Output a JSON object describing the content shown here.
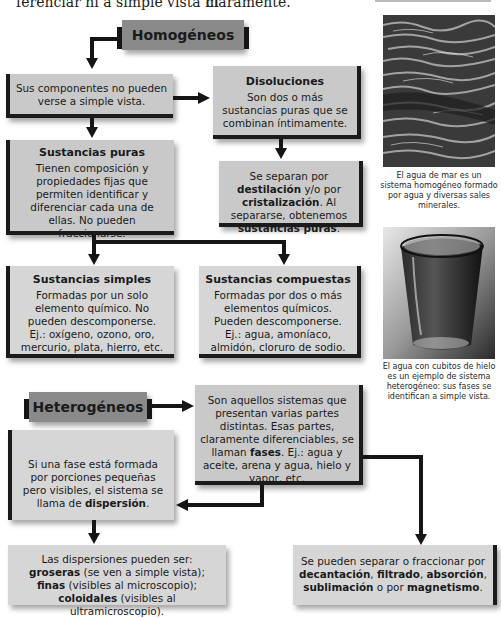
{
  "top_text": {
    "left": "ferenciar ni a simple vista ni",
    "right": "claramente."
  },
  "homogeneos": {
    "header": "Homogéneos",
    "no_visible": "Sus componentes no pueden verse a simple vista.",
    "disoluciones": {
      "title": "Disoluciones",
      "body": "Son dos o más sustancias puras que se combinan íntimamente."
    },
    "separacion": {
      "p1": "Se separan por ",
      "b1": "destilación",
      "p2": " y/o por ",
      "b2": "cristalización",
      "p3": ". Al separarse, obtenemos ",
      "b3": "sustancias puras",
      "p4": "."
    },
    "sustancias_puras": {
      "title": "Sustancias puras",
      "body": "Tienen composición y propiedades fijas que permiten identificar y diferenciar cada una de ellas. No pueden fraccionarse."
    },
    "sustancias_simples": {
      "title": "Sustancias simples",
      "body": "Formadas por un solo elemento químico. No pueden descomponerse. Ej.: oxígeno, ozono, oro, mercurio, plata, hierro, etc."
    },
    "sustancias_compuestas": {
      "title": "Sustancias compuestas",
      "body": "Formadas por dos o más elementos químicos. Pueden descomponerse. Ej.: agua, amoníaco, almidón, cloruro de sodio."
    }
  },
  "heterogeneos": {
    "header": "Heterogéneos",
    "definicion": {
      "p1": "Son aquellos sistemas que presentan varias partes distintas. Esas partes, claramente diferenciables, se llaman ",
      "b1": "fases",
      "p2": ". Ej.: agua y aceite, arena y agua, hielo y vapor, etc."
    },
    "dispersion": {
      "p1": "Si una fase está formada por porciones pequeñas pero visibles, el sistema se llama de ",
      "b1": "dispersión",
      "p2": "."
    },
    "tipos_dispersion": {
      "p1": "Las dispersiones pueden ser: ",
      "b1": "groseras",
      "p2": " (se ven a simple vista); ",
      "b2": "finas",
      "p3": " (visibles al microscopio); ",
      "b3": "coloidales",
      "p4": " (visibles al ultramicroscopio)."
    },
    "separacion": {
      "p1": "Se pueden separar o fraccionar por ",
      "b1": "decantación",
      "c1": ", ",
      "b2": "filtrado",
      "c2": ", ",
      "b3": "absorción",
      "c3": ", ",
      "b4": "sublimación",
      "p2": " o por ",
      "b5": "magnetismo",
      "p3": "."
    }
  },
  "photos": {
    "sea": {
      "caption": "El agua de mar es un sistema homogéneo formado por agua y diversas sales minerales."
    },
    "glass": {
      "caption": "El agua con cubitos de hielo es un ejemplo de sistema heterogéneo: sus fases se identifican a simple vista."
    }
  }
}
